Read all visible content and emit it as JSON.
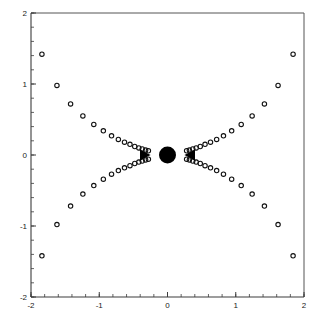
{
  "figure": {
    "width": 319,
    "height": 323,
    "background": "#ffffff",
    "marker_color": "#111111",
    "axis_color": "#3c3c3c",
    "frame_color": "#555555",
    "accent_color": "#000000"
  },
  "plot_area": {
    "left": 31,
    "top": 13,
    "right": 304,
    "bottom": 297
  },
  "chart_data": {
    "type": "scatter",
    "title": "",
    "subtitle": "",
    "xlabel": "",
    "ylabel": "",
    "xlim": [
      -2,
      2
    ],
    "ylim": [
      -2,
      2
    ],
    "grid": false,
    "legend": null,
    "legend_position": "none",
    "x_ticks": [
      -2,
      -1,
      0,
      1,
      2
    ],
    "x_tick_labels": [
      "-2",
      "-1",
      "0",
      "1",
      "2"
    ],
    "y_ticks": [
      -2,
      -1,
      0,
      1,
      2
    ],
    "y_tick_labels": [
      "-2",
      "-1",
      "0",
      "1",
      "2"
    ],
    "x_minor_tick_step": 0.2,
    "y_minor_tick_step": 0.2,
    "marker_style": "open-circle",
    "marker_size": 2.2,
    "series": [
      {
        "name": "trajectory-upper-left",
        "points": [
          [
            -1.84,
            1.42
          ],
          [
            -1.62,
            0.98
          ],
          [
            -1.42,
            0.72
          ],
          [
            -1.24,
            0.55
          ],
          [
            -1.08,
            0.43
          ],
          [
            -0.94,
            0.34
          ],
          [
            -0.82,
            0.27
          ],
          [
            -0.72,
            0.22
          ],
          [
            -0.63,
            0.18
          ],
          [
            -0.55,
            0.15
          ],
          [
            -0.48,
            0.12
          ],
          [
            -0.42,
            0.1
          ],
          [
            -0.37,
            0.085
          ],
          [
            -0.32,
            0.07
          ],
          [
            -0.28,
            0.06
          ]
        ]
      },
      {
        "name": "trajectory-lower-left",
        "points": [
          [
            -1.84,
            -1.42
          ],
          [
            -1.62,
            -0.98
          ],
          [
            -1.42,
            -0.72
          ],
          [
            -1.24,
            -0.55
          ],
          [
            -1.08,
            -0.43
          ],
          [
            -0.94,
            -0.34
          ],
          [
            -0.82,
            -0.27
          ],
          [
            -0.72,
            -0.22
          ],
          [
            -0.63,
            -0.18
          ],
          [
            -0.55,
            -0.15
          ],
          [
            -0.48,
            -0.12
          ],
          [
            -0.42,
            -0.1
          ],
          [
            -0.37,
            -0.085
          ],
          [
            -0.32,
            -0.07
          ],
          [
            -0.28,
            -0.06
          ]
        ]
      },
      {
        "name": "trajectory-upper-right",
        "points": [
          [
            1.84,
            1.42
          ],
          [
            1.62,
            0.98
          ],
          [
            1.42,
            0.72
          ],
          [
            1.24,
            0.55
          ],
          [
            1.08,
            0.43
          ],
          [
            0.94,
            0.34
          ],
          [
            0.82,
            0.27
          ],
          [
            0.72,
            0.22
          ],
          [
            0.63,
            0.18
          ],
          [
            0.55,
            0.15
          ],
          [
            0.48,
            0.12
          ],
          [
            0.42,
            0.1
          ],
          [
            0.37,
            0.085
          ],
          [
            0.32,
            0.07
          ],
          [
            0.28,
            0.06
          ]
        ]
      },
      {
        "name": "trajectory-lower-right",
        "points": [
          [
            1.84,
            -1.42
          ],
          [
            1.62,
            -0.98
          ],
          [
            1.42,
            -0.72
          ],
          [
            1.24,
            -0.55
          ],
          [
            1.08,
            -0.43
          ],
          [
            0.94,
            -0.34
          ],
          [
            0.82,
            -0.27
          ],
          [
            0.72,
            -0.22
          ],
          [
            0.63,
            -0.18
          ],
          [
            0.55,
            -0.15
          ],
          [
            0.48,
            -0.12
          ],
          [
            0.42,
            -0.1
          ],
          [
            0.37,
            -0.085
          ],
          [
            0.32,
            -0.07
          ],
          [
            0.28,
            -0.06
          ]
        ]
      }
    ],
    "annotations": [
      {
        "name": "fixed-point",
        "type": "filled-circle",
        "x": 0,
        "y": 0,
        "radius": 8.5
      },
      {
        "name": "flow-arrow-left",
        "type": "triangle-right",
        "x": -0.33,
        "y": 0,
        "size": 9
      },
      {
        "name": "flow-arrow-right",
        "type": "triangle-left",
        "x": 0.33,
        "y": 0,
        "size": 9
      }
    ]
  }
}
